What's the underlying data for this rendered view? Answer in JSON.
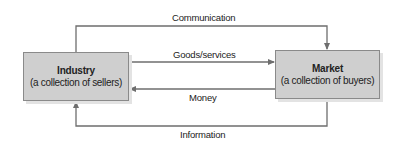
{
  "diagram": {
    "type": "flow",
    "nodes": {
      "industry": {
        "title": "Industry",
        "subtitle": "(a collection of sellers)"
      },
      "market": {
        "title": "Market",
        "subtitle": "(a collection of buyers)"
      }
    },
    "flows": [
      {
        "label": "Communication",
        "from": "Industry",
        "to": "Market"
      },
      {
        "label": "Goods/services",
        "from": "Industry",
        "to": "Market"
      },
      {
        "label": "Money",
        "from": "Market",
        "to": "Industry"
      },
      {
        "label": "Information",
        "from": "Market",
        "to": "Industry"
      }
    ],
    "colors": {
      "box_fill": "#cfcfcf",
      "box_border": "#8a8a8a",
      "line": "#6e6e6e",
      "text": "#222222"
    }
  }
}
